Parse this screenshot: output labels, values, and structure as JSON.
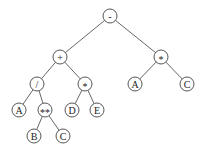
{
  "diagram": {
    "type": "expression-tree",
    "node_radius": 7,
    "colors": {
      "stroke": "#444444",
      "edge": "#555555",
      "text": "#222222",
      "background": "#ffffff"
    },
    "nodes": [
      {
        "id": "n0",
        "label": "-",
        "x": 110,
        "y": 16
      },
      {
        "id": "n1",
        "label": "+",
        "x": 60,
        "y": 57
      },
      {
        "id": "n2",
        "label": "*",
        "x": 161,
        "y": 57
      },
      {
        "id": "n3",
        "label": "/",
        "x": 37,
        "y": 84
      },
      {
        "id": "n4",
        "label": "*",
        "x": 85,
        "y": 84
      },
      {
        "id": "n5",
        "label": "A",
        "x": 135,
        "y": 84
      },
      {
        "id": "n6",
        "label": "C",
        "x": 187,
        "y": 84
      },
      {
        "id": "n7",
        "label": "A",
        "x": 19,
        "y": 110
      },
      {
        "id": "n8",
        "label": "**",
        "x": 45,
        "y": 110
      },
      {
        "id": "n9",
        "label": "D",
        "x": 72,
        "y": 110
      },
      {
        "id": "n10",
        "label": "E",
        "x": 97,
        "y": 110
      },
      {
        "id": "n11",
        "label": "B",
        "x": 34,
        "y": 136
      },
      {
        "id": "n12",
        "label": "C",
        "x": 63,
        "y": 136
      }
    ],
    "edges": [
      [
        "n0",
        "n1"
      ],
      [
        "n0",
        "n2"
      ],
      [
        "n1",
        "n3"
      ],
      [
        "n1",
        "n4"
      ],
      [
        "n2",
        "n5"
      ],
      [
        "n2",
        "n6"
      ],
      [
        "n3",
        "n7"
      ],
      [
        "n3",
        "n8"
      ],
      [
        "n4",
        "n9"
      ],
      [
        "n4",
        "n10"
      ],
      [
        "n8",
        "n11"
      ],
      [
        "n8",
        "n12"
      ]
    ]
  }
}
